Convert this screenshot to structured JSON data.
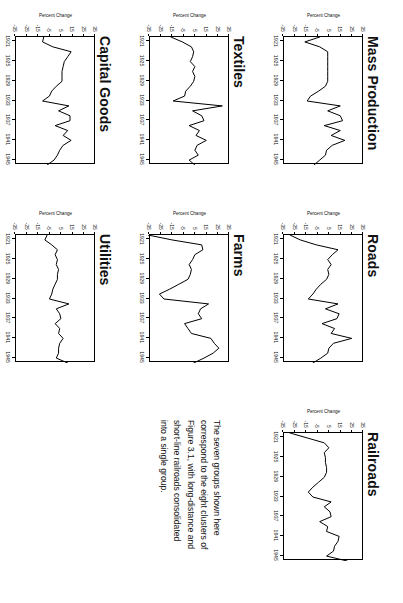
{
  "figure": {
    "orientation_degrees": 90,
    "y_axis_label": "Percent Change",
    "y_ticks": [
      "35",
      "25",
      "15",
      "5",
      "-5",
      "-15",
      "-25",
      "-35"
    ],
    "x_ticks": [
      "1921",
      "1925",
      "1929",
      "1933",
      "1937",
      "1941",
      "1945"
    ]
  },
  "caption": {
    "lines": [
      "The seven groups shown here",
      "correspond to the eight clusters of",
      "Figure 3.1, with long-distance and",
      "short-line railroads consolidated",
      "into a single group."
    ]
  },
  "chart_data": [
    {
      "type": "line",
      "title": "Mass Production",
      "xlabel": "",
      "ylabel": "Percent Change",
      "ylim": [
        -35,
        35
      ],
      "xlim": [
        1920,
        1946
      ],
      "grid": false,
      "legend": "none",
      "x": [
        1920,
        1921,
        1922,
        1923,
        1924,
        1925,
        1926,
        1927,
        1928,
        1929,
        1930,
        1931,
        1932,
        1933,
        1934,
        1935,
        1936,
        1937,
        1938,
        1939,
        1940,
        1941,
        1942,
        1943,
        1944,
        1945,
        1946
      ],
      "values": [
        -2,
        -15,
        -2,
        5,
        5,
        5,
        5,
        5,
        5,
        5,
        3,
        -3,
        -10,
        -13,
        16,
        5,
        16,
        18,
        2,
        16,
        8,
        20,
        9,
        4,
        3,
        -2,
        -7
      ]
    },
    {
      "type": "line",
      "title": "Textiles",
      "xlabel": "",
      "ylabel": "Percent Change",
      "ylim": [
        -35,
        35
      ],
      "xlim": [
        1920,
        1946
      ],
      "grid": false,
      "legend": "none",
      "x": [
        1920,
        1921,
        1922,
        1923,
        1924,
        1925,
        1926,
        1927,
        1928,
        1929,
        1930,
        1931,
        1932,
        1933,
        1934,
        1935,
        1936,
        1937,
        1938,
        1939,
        1940,
        1941,
        1942,
        1943,
        1944,
        1945,
        1946
      ],
      "values": [
        -15,
        -5,
        3,
        5,
        4,
        2,
        6,
        4,
        6,
        5,
        2,
        -2,
        -3,
        -13,
        30,
        4,
        12,
        14,
        1,
        10,
        7,
        16,
        8,
        6,
        9,
        1,
        6
      ]
    },
    {
      "type": "line",
      "title": "Capital Goods",
      "xlabel": "",
      "ylabel": "Percent Change",
      "ylim": [
        -35,
        35
      ],
      "xlim": [
        1920,
        1946
      ],
      "grid": false,
      "legend": "none",
      "x": [
        1920,
        1921,
        1922,
        1923,
        1924,
        1925,
        1926,
        1927,
        1928,
        1929,
        1930,
        1931,
        1932,
        1933,
        1934,
        1935,
        1936,
        1937,
        1938,
        1939,
        1940,
        1941,
        1942,
        1943,
        1944,
        1945,
        1946
      ],
      "values": [
        -9,
        -10,
        -1,
        15,
        12,
        9,
        8,
        7,
        7,
        7,
        2,
        -2,
        -4,
        -10,
        13,
        4,
        14,
        14,
        1,
        12,
        8,
        15,
        8,
        5,
        3,
        0,
        -6
      ]
    },
    {
      "type": "line",
      "title": "Roads",
      "xlabel": "",
      "ylabel": "Percent Change",
      "ylim": [
        -35,
        35
      ],
      "xlim": [
        1920,
        1946
      ],
      "grid": false,
      "legend": "none",
      "x": [
        1920,
        1921,
        1922,
        1923,
        1924,
        1925,
        1926,
        1927,
        1928,
        1929,
        1930,
        1931,
        1932,
        1933,
        1934,
        1935,
        1936,
        1937,
        1938,
        1939,
        1940,
        1941,
        1942,
        1943,
        1944,
        1945,
        1946
      ],
      "values": [
        -28,
        -19,
        -5,
        14,
        9,
        5,
        8,
        5,
        6,
        4,
        -1,
        -5,
        -8,
        -12,
        14,
        3,
        15,
        13,
        0,
        11,
        8,
        26,
        10,
        6,
        5,
        -1,
        -8
      ]
    },
    {
      "type": "line",
      "title": "Farms",
      "xlabel": "",
      "ylabel": "Percent Change",
      "ylim": [
        -35,
        35
      ],
      "xlim": [
        1920,
        1946
      ],
      "grid": false,
      "legend": "none",
      "x": [
        1920,
        1921,
        1922,
        1923,
        1924,
        1925,
        1926,
        1927,
        1928,
        1929,
        1930,
        1931,
        1932,
        1933,
        1934,
        1935,
        1936,
        1937,
        1938,
        1939,
        1940,
        1941,
        1942,
        1943,
        1944,
        1945,
        1946
      ],
      "values": [
        -35,
        -14,
        12,
        13,
        6,
        4,
        1,
        3,
        2,
        0,
        -8,
        -16,
        -25,
        -21,
        18,
        11,
        9,
        12,
        -3,
        0,
        3,
        20,
        23,
        27,
        22,
        14,
        5
      ]
    },
    {
      "type": "line",
      "title": "Utilities",
      "xlabel": "",
      "ylabel": "Percent Change",
      "ylim": [
        -35,
        35
      ],
      "xlim": [
        1920,
        1946
      ],
      "grid": false,
      "legend": "none",
      "x": [
        1920,
        1921,
        1922,
        1923,
        1924,
        1925,
        1926,
        1927,
        1928,
        1929,
        1930,
        1931,
        1932,
        1933,
        1934,
        1935,
        1936,
        1937,
        1938,
        1939,
        1940,
        1941,
        1942,
        1943,
        1944,
        1945,
        1946
      ],
      "values": [
        -6,
        -8,
        -2,
        3,
        1,
        3,
        2,
        4,
        3,
        3,
        1,
        -1,
        -2,
        -4,
        13,
        2,
        5,
        6,
        1,
        5,
        4,
        8,
        5,
        4,
        4,
        2,
        12
      ]
    },
    {
      "type": "line",
      "title": "Railroads",
      "xlabel": "",
      "ylabel": "Percent Change",
      "ylim": [
        -35,
        35
      ],
      "xlim": [
        1920,
        1946
      ],
      "grid": false,
      "legend": "none",
      "x": [
        1920,
        1921,
        1922,
        1923,
        1924,
        1925,
        1926,
        1927,
        1928,
        1929,
        1930,
        1931,
        1932,
        1933,
        1934,
        1935,
        1936,
        1937,
        1938,
        1939,
        1940,
        1941,
        1942,
        1943,
        1944,
        1945,
        1946
      ],
      "values": [
        -28,
        -13,
        2,
        6,
        2,
        3,
        3,
        4,
        4,
        2,
        -3,
        -8,
        -12,
        -8,
        8,
        2,
        7,
        8,
        -2,
        5,
        4,
        15,
        14,
        11,
        10,
        4,
        22
      ]
    }
  ]
}
